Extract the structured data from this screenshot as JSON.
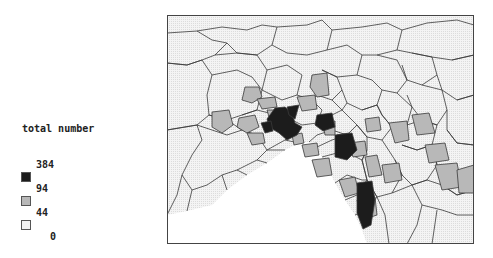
{
  "legend": {
    "title": "total number",
    "breaks": [
      "384",
      "94",
      "44",
      "0"
    ],
    "classes": [
      {
        "range": "94–384",
        "color": "#1c1c1c"
      },
      {
        "range": "44–94",
        "color": "#b8b8b8"
      },
      {
        "range": "0–44",
        "color": "#f2f2f2"
      }
    ]
  },
  "map": {
    "region_border_color": "#3a3a3a",
    "frame_color": "#444444",
    "water_color": "#ffffff"
  }
}
